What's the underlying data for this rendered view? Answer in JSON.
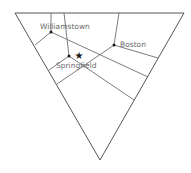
{
  "diagram": {
    "type": "ternary-voronoi-map",
    "colors": {
      "lines": "#6e6e6e",
      "nodes": "#1a1a1a",
      "labels": "#6a6a6a",
      "background": "#ffffff"
    },
    "cities": [
      {
        "name": "Williamstown",
        "x": 51,
        "y": 32
      },
      {
        "name": "Springfield",
        "x": 69,
        "y": 56
      },
      {
        "name": "Boston",
        "x": 114,
        "y": 45
      }
    ],
    "marker": {
      "icon": "star-icon",
      "glyph": "★",
      "x": 79,
      "y": 55
    }
  }
}
